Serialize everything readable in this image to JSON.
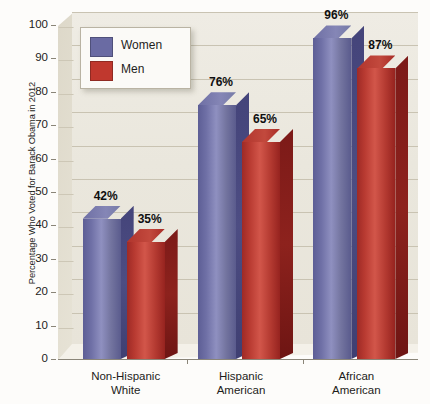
{
  "chart_data": {
    "type": "bar",
    "title": "",
    "subtitle": "",
    "xlabel": "",
    "ylabel": "Percentage Who Voted for Barack Obama in 2012",
    "ylim": [
      0,
      100
    ],
    "yticks": [
      0,
      10,
      20,
      30,
      40,
      50,
      60,
      70,
      80,
      90,
      100
    ],
    "ytick_labels": [
      "0",
      "10",
      "20",
      "30",
      "40",
      "50",
      "60",
      "70",
      "80",
      "90",
      "100"
    ],
    "grid": true,
    "grid_orientation": "horizontal",
    "legend_position": "top-left-inside",
    "value_label_suffix": "%",
    "categories": [
      "Non-Hispanic White",
      "Hispanic American",
      "African American"
    ],
    "category_lines": [
      [
        "Non-Hispanic",
        "White"
      ],
      [
        "Hispanic",
        "American"
      ],
      [
        "African",
        "American"
      ]
    ],
    "series": [
      {
        "name": "Women",
        "color": "#6a6ba3",
        "values": [
          42,
          76,
          96
        ],
        "value_labels": [
          "42%",
          "76%",
          "96%"
        ]
      },
      {
        "name": "Men",
        "color": "#c0382e",
        "values": [
          35,
          65,
          87
        ],
        "value_labels": [
          "35%",
          "65%",
          "87%"
        ]
      }
    ]
  },
  "legend": {
    "items": [
      {
        "label": "Women",
        "color": "#6a6ba3"
      },
      {
        "label": "Men",
        "color": "#c0382e"
      }
    ]
  },
  "colors": {
    "plot_background": "#eae7dd",
    "page_background": "#fdfcfa",
    "gridline": "#c9c3b2",
    "axis": "#8a8578",
    "text": "#1d1d1b",
    "women": "#6a6ba3",
    "men": "#c0382e"
  }
}
